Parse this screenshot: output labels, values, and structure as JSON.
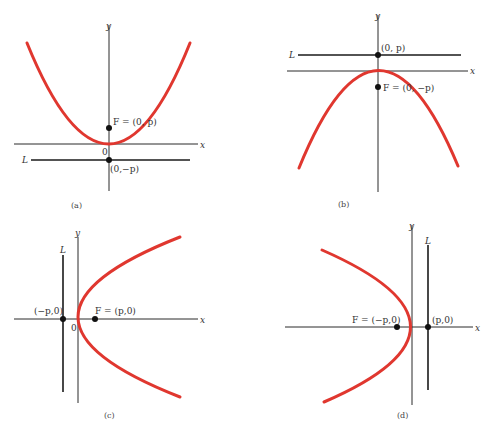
{
  "colors": {
    "curve": "#e0372f",
    "axes": "#2a2a2a"
  },
  "panels": [
    {
      "id": "a",
      "caption": "(a)",
      "orientation": "opens-up",
      "x_label": "x",
      "y_label": "y",
      "origin_label": "0",
      "directrix_label": "L",
      "focus_label": "F = (0, p)",
      "directrix_point_label": "(0,−p)"
    },
    {
      "id": "b",
      "caption": "(b)",
      "orientation": "opens-down",
      "x_label": "x",
      "y_label": "y",
      "directrix_label": "L",
      "focus_label": "F = (0, −p)",
      "directrix_point_label": "(0, p)"
    },
    {
      "id": "c",
      "caption": "(c)",
      "orientation": "opens-right",
      "x_label": "x",
      "y_label": "y",
      "origin_label": "0",
      "directrix_label": "L",
      "focus_label": "F = (p,0)",
      "directrix_point_label": "(−p,0)"
    },
    {
      "id": "d",
      "caption": "(d)",
      "orientation": "opens-left",
      "x_label": "x",
      "y_label": "y",
      "directrix_label": "L",
      "focus_label": "F = (−p,0)",
      "directrix_point_label": "(p,0)"
    }
  ]
}
